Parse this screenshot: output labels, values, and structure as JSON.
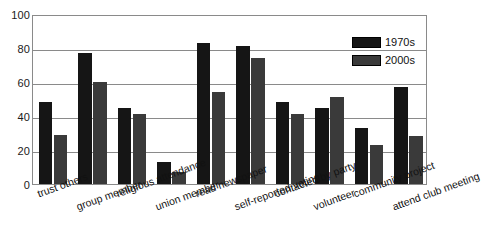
{
  "chart_data": {
    "type": "bar",
    "title": "",
    "xlabel": "",
    "ylabel": "",
    "ylim": [
      0,
      100
    ],
    "yticks": [
      0,
      20,
      40,
      60,
      80,
      100
    ],
    "grid": true,
    "legend_position": "top-right",
    "categories": [
      "trust others",
      "group member",
      "religious attendance",
      "union member",
      "read newspaper",
      "self-reported voting",
      "contacted by party",
      "volunteer",
      "community project",
      "attend club meeting"
    ],
    "series": [
      {
        "name": "1970s",
        "color": "#151515",
        "values": [
          48,
          77,
          45,
          13,
          83,
          81,
          48,
          45,
          33,
          57
        ]
      },
      {
        "name": "2000s",
        "color": "#3a3a3a",
        "values": [
          29,
          60,
          41,
          7,
          54,
          74,
          41,
          51,
          23,
          28
        ]
      }
    ]
  },
  "axis": {
    "y_tick_labels": [
      "100",
      "80",
      "60",
      "40",
      "20",
      "0"
    ]
  },
  "legend": {
    "items": [
      {
        "label": "1970s"
      },
      {
        "label": "2000s"
      }
    ]
  }
}
